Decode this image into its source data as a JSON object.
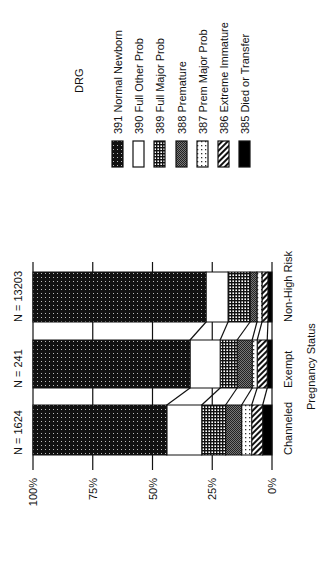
{
  "chart_data": {
    "type": "bar",
    "stacked": true,
    "normalized_percent": true,
    "orientation": "vertical (image rotated 90° clockwise)",
    "title": "",
    "xlabel": "Pregnancy Status",
    "ylabel": "",
    "ylim": [
      0,
      100
    ],
    "y_ticks": [
      "0%",
      "25%",
      "50%",
      "75%",
      "100%"
    ],
    "grid": true,
    "legend_title": "DRG",
    "legend_position": "right",
    "categories": [
      "Channeled",
      "Exempt",
      "Non-High Risk"
    ],
    "n_labels": [
      "N = 1624",
      "N = 241",
      "N = 13203"
    ],
    "series": [
      {
        "name": "391 Normal Newborn",
        "pattern": "dense-dots",
        "values": [
          56.0,
          65.7,
          72.4
        ]
      },
      {
        "name": "390 Full Other Prob",
        "pattern": "white",
        "values": [
          14.6,
          12.6,
          9.2
        ]
      },
      {
        "name": "389 Full Major Prob",
        "pattern": "grid",
        "values": [
          10.0,
          7.1,
          9.2
        ]
      },
      {
        "name": "388 Premature",
        "pattern": "fine-checker",
        "values": [
          6.7,
          6.3,
          2.9
        ]
      },
      {
        "name": "387 Prem Major Prob",
        "pattern": "sparse-dots",
        "values": [
          4.2,
          2.1,
          2.1
        ]
      },
      {
        "name": "386 Extreme Immature",
        "pattern": "diagonal-stripes",
        "values": [
          4.6,
          4.2,
          2.5
        ]
      },
      {
        "name": "385 Died or Transfer",
        "pattern": "solid-black",
        "values": [
          3.9,
          2.0,
          1.7
        ]
      }
    ]
  }
}
